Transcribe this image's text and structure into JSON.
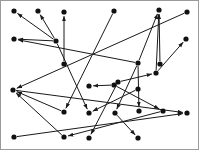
{
  "figure": {
    "type": "directed-graph-scatter",
    "width": 199,
    "height": 150,
    "background_color": "#ffffff",
    "border_color": "#9a9a9a",
    "node_color": "#111111",
    "edge_color": "#1a1a1a",
    "node_radius": 2.6,
    "edge_width": 1,
    "arrowhead": "filled-triangle",
    "node_count": 28,
    "edge_count": 25,
    "title": "",
    "axis_labels": [],
    "legend": [],
    "annotations": []
  },
  "chart_data": {
    "type": "scatter",
    "title": "",
    "xlabel": "",
    "ylabel": "",
    "xlim": [
      0,
      199
    ],
    "ylim": [
      0,
      150
    ],
    "grid": false,
    "legend_position": "none",
    "nodes": [
      {
        "id": "n1",
        "x": 13,
        "y": 10
      },
      {
        "id": "n2",
        "x": 37,
        "y": 10
      },
      {
        "id": "n3",
        "x": 63,
        "y": 11
      },
      {
        "id": "n4",
        "x": 113,
        "y": 10
      },
      {
        "id": "n5",
        "x": 158,
        "y": 9
      },
      {
        "id": "n6",
        "x": 186,
        "y": 11
      },
      {
        "id": "n7",
        "x": 13,
        "y": 38
      },
      {
        "id": "n8",
        "x": 185,
        "y": 38
      },
      {
        "id": "n9",
        "x": 55,
        "y": 40
      },
      {
        "id": "n10",
        "x": 137,
        "y": 62
      },
      {
        "id": "n11",
        "x": 63,
        "y": 63
      },
      {
        "id": "n12",
        "x": 159,
        "y": 63
      },
      {
        "id": "n13",
        "x": 12,
        "y": 89
      },
      {
        "id": "n14",
        "x": 88,
        "y": 85
      },
      {
        "id": "n15",
        "x": 113,
        "y": 84
      },
      {
        "id": "n16",
        "x": 117,
        "y": 81
      },
      {
        "id": "n17",
        "x": 155,
        "y": 72
      },
      {
        "id": "n18",
        "x": 137,
        "y": 88
      },
      {
        "id": "n19",
        "x": 63,
        "y": 111
      },
      {
        "id": "n20",
        "x": 88,
        "y": 112
      },
      {
        "id": "n21",
        "x": 114,
        "y": 112
      },
      {
        "id": "n22",
        "x": 138,
        "y": 110
      },
      {
        "id": "n23",
        "x": 162,
        "y": 110
      },
      {
        "id": "n24",
        "x": 186,
        "y": 112
      },
      {
        "id": "n25",
        "x": 13,
        "y": 136
      },
      {
        "id": "n26",
        "x": 63,
        "y": 136
      },
      {
        "id": "n27",
        "x": 88,
        "y": 137
      },
      {
        "id": "n28",
        "x": 137,
        "y": 137
      }
    ],
    "edges": [
      {
        "source": "n9",
        "target": "n1"
      },
      {
        "source": "n9",
        "target": "n2"
      },
      {
        "source": "n9",
        "target": "n7"
      },
      {
        "source": "n10",
        "target": "n7"
      },
      {
        "source": "n11",
        "target": "n3"
      },
      {
        "source": "n10",
        "target": "n5"
      },
      {
        "source": "n12",
        "target": "n5"
      },
      {
        "source": "n17",
        "target": "n5"
      },
      {
        "source": "n17",
        "target": "n8"
      },
      {
        "source": "n4",
        "target": "n19"
      },
      {
        "source": "n9",
        "target": "n20"
      },
      {
        "source": "n6",
        "target": "n13"
      },
      {
        "source": "n19",
        "target": "n13"
      },
      {
        "source": "n26",
        "target": "n13"
      },
      {
        "source": "n15",
        "target": "n14"
      },
      {
        "source": "n16",
        "target": "n17"
      },
      {
        "source": "n18",
        "target": "n20"
      },
      {
        "source": "n10",
        "target": "n21"
      },
      {
        "source": "n10",
        "target": "n22"
      },
      {
        "source": "n15",
        "target": "n23"
      },
      {
        "source": "n13",
        "target": "n24"
      },
      {
        "source": "n25",
        "target": "n24"
      },
      {
        "source": "n23",
        "target": "n26"
      },
      {
        "source": "n16",
        "target": "n27"
      },
      {
        "source": "n21",
        "target": "n28"
      }
    ]
  }
}
